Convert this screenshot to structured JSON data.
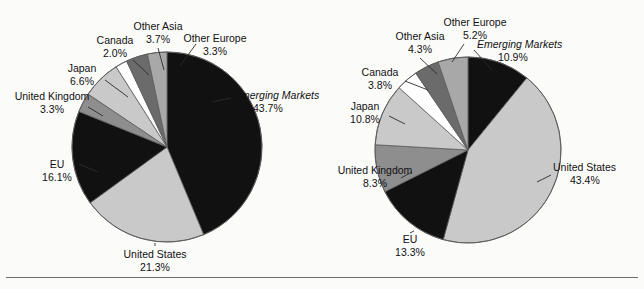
{
  "figure": {
    "background_color": "#fbfbfa",
    "rule_color": "#6e6e6e",
    "palette": {
      "black": "#111111",
      "light_gray": "#c9c9c9",
      "medium_gray": "#8e8e8e",
      "dark_gray": "#6b6b6b",
      "white": "#ffffff",
      "outline": "#5a5a5a"
    }
  },
  "chart_data": [
    {
      "type": "pie",
      "id": "left-pie",
      "title": "",
      "start_angle_deg": 0,
      "direction": "clockwise",
      "categories": [
        "Emerging Markets",
        "United States",
        "EU",
        "United Kingdom",
        "Japan",
        "Canada",
        "Other Asia",
        "Other Europe"
      ],
      "values": [
        43.7,
        21.3,
        16.1,
        3.3,
        6.6,
        2.0,
        3.7,
        3.3
      ],
      "value_labels": [
        "43.7%",
        "21.3%",
        "16.1%",
        "3.3%",
        "6.6%",
        "2.0%",
        "3.7%",
        "3.3%"
      ],
      "colors": [
        "#111111",
        "#c9c9c9",
        "#111111",
        "#8e8e8e",
        "#c9c9c9",
        "#ffffff",
        "#6b6b6b",
        "#a8a8a8"
      ],
      "italic_labels": [
        "Emerging Markets"
      ],
      "legend": "none"
    },
    {
      "type": "pie",
      "id": "right-pie",
      "title": "",
      "start_angle_deg": 0,
      "direction": "clockwise",
      "categories": [
        "Emerging Markets",
        "United States",
        "EU",
        "United Kingdom",
        "Japan",
        "Canada",
        "Other Asia",
        "Other Europe"
      ],
      "values": [
        10.9,
        43.4,
        13.3,
        8.3,
        10.8,
        3.8,
        4.3,
        5.2
      ],
      "value_labels": [
        "10.9%",
        "43.4%",
        "13.3%",
        "8.3%",
        "10.8%",
        "3.8%",
        "4.3%",
        "5.2%"
      ],
      "colors": [
        "#111111",
        "#c9c9c9",
        "#111111",
        "#8e8e8e",
        "#c9c9c9",
        "#ffffff",
        "#6b6b6b",
        "#a8a8a8"
      ],
      "italic_labels": [
        "Emerging Markets"
      ],
      "legend": "none"
    }
  ],
  "left_chart": {
    "labels": {
      "emerging_markets_name": "Emerging Markets",
      "emerging_markets_value": "43.7%",
      "united_states_name": "United States",
      "united_states_value": "21.3%",
      "eu_name": "EU",
      "eu_value": "16.1%",
      "united_kingdom_name": "United Kingdom",
      "united_kingdom_value": "3.3%",
      "japan_name": "Japan",
      "japan_value": "6.6%",
      "canada_name": "Canada",
      "canada_value": "2.0%",
      "other_asia_name": "Other Asia",
      "other_asia_value": "3.7%",
      "other_europe_name": "Other Europe",
      "other_europe_value": "3.3%"
    }
  },
  "right_chart": {
    "labels": {
      "emerging_markets_name": "Emerging Markets",
      "emerging_markets_value": "10.9%",
      "united_states_name": "United States",
      "united_states_value": "43.4%",
      "eu_name": "EU",
      "eu_value": "13.3%",
      "united_kingdom_name": "United Kingdom",
      "united_kingdom_value": "8.3%",
      "japan_name": "Japan",
      "japan_value": "10.8%",
      "canada_name": "Canada",
      "canada_value": "3.8%",
      "other_asia_name": "Other Asia",
      "other_asia_value": "4.3%",
      "other_europe_name": "Other Europe",
      "other_europe_value": "5.2%"
    }
  }
}
